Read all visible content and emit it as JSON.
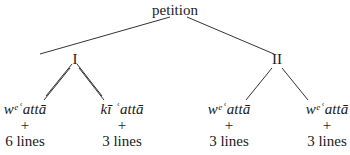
{
  "tree": {
    "root": {
      "label": "petition"
    },
    "branches": [
      {
        "label": "I",
        "leaves": [
          {
            "term": "wᵉʿattā",
            "plus": "+",
            "lines": "6 lines"
          },
          {
            "term": "kī ʿattā",
            "plus": "+",
            "lines": "3 lines"
          }
        ]
      },
      {
        "label": "II",
        "leaves": [
          {
            "term": "wᵉʿattā",
            "plus": "+",
            "lines": "3 lines"
          },
          {
            "term": "wᵉʿattā",
            "plus": "+",
            "lines": "3 lines"
          }
        ]
      }
    ]
  }
}
